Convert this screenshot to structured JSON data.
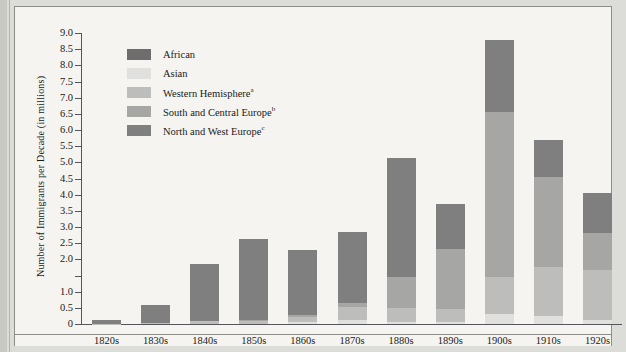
{
  "figure": {
    "ylabel": "Number of Immigrants per Decade (in millions)"
  },
  "legend": {
    "items": [
      {
        "label": "African",
        "sup": "",
        "color": "#6d6d6d",
        "key": "african"
      },
      {
        "label": "Asian",
        "sup": "",
        "color": "#e0e0de",
        "key": "asian"
      },
      {
        "label": "Western Hemisphere",
        "sup": "a",
        "color": "#bdbdbb",
        "key": "western_hemisphere"
      },
      {
        "label": "South and Central Europe",
        "sup": "b",
        "color": "#a6a6a4",
        "key": "south_central_europe"
      },
      {
        "label": "North and West Europe",
        "sup": "c",
        "color": "#7f7f7f",
        "key": "north_west_europe"
      }
    ]
  },
  "axis": {
    "ticks": [
      {
        "value": 9.0,
        "label": "9.0"
      },
      {
        "value": 8.5,
        "label": "8.5"
      },
      {
        "value": 8.0,
        "label": "8.0"
      },
      {
        "value": 7.5,
        "label": "7.5"
      },
      {
        "value": 7.0,
        "label": "7.0"
      },
      {
        "value": 6.5,
        "label": "6.5"
      },
      {
        "value": 6.0,
        "label": "6.0"
      },
      {
        "value": 5.5,
        "label": "5.5"
      },
      {
        "value": 5.0,
        "label": "5.0"
      },
      {
        "value": 4.5,
        "label": "4.5"
      },
      {
        "value": 4.0,
        "label": "4.0"
      },
      {
        "value": 3.5,
        "label": "3.5"
      },
      {
        "value": 3.0,
        "label": "3.0"
      },
      {
        "value": 2.5,
        "label": "2.5"
      },
      {
        "value": 2.0,
        "label": "2.0"
      },
      {
        "value": 1.5,
        "label": ""
      },
      {
        "value": 1.0,
        "label": "1.0"
      },
      {
        "value": 0.5,
        "label": "0.5"
      },
      {
        "value": 0.0,
        "label": "0"
      }
    ]
  },
  "chart_data": {
    "type": "bar",
    "subtype": "stacked",
    "title": "",
    "xlabel": "",
    "ylabel": "Number of Immigrants per Decade (in millions)",
    "ylim": [
      0,
      9.0
    ],
    "ytick_step": 0.5,
    "grid": false,
    "legend_position": "inside-top-left",
    "categories": [
      "1820s",
      "1830s",
      "1840s",
      "1850s",
      "1860s",
      "1870s",
      "1880s",
      "1890s",
      "1900s",
      "1910s",
      "1920s"
    ],
    "series": [
      {
        "name": "African",
        "color": "#6d6d6d",
        "values": [
          0.0,
          0.0,
          0.0,
          0.0,
          0.0,
          0.0,
          0.0,
          0.0,
          0.0,
          0.0,
          0.0
        ]
      },
      {
        "name": "Asian",
        "color": "#e0e0de",
        "values": [
          0.0,
          0.0,
          0.0,
          0.0,
          0.05,
          0.12,
          0.07,
          0.07,
          0.3,
          0.25,
          0.11
        ]
      },
      {
        "name": "Western Hemisphere",
        "color": "#bdbdbb",
        "values": [
          0.01,
          0.03,
          0.08,
          0.08,
          0.17,
          0.4,
          0.43,
          0.4,
          1.15,
          1.5,
          1.55
        ]
      },
      {
        "name": "South and Central Europe",
        "color": "#a6a6a4",
        "values": [
          0.0,
          0.0,
          0.0,
          0.03,
          0.05,
          0.13,
          0.95,
          1.85,
          5.1,
          2.8,
          1.15
        ]
      },
      {
        "name": "North and West Europe",
        "color": "#7f7f7f",
        "values": [
          0.11,
          0.56,
          1.79,
          2.51,
          2.03,
          2.2,
          3.7,
          1.38,
          2.25,
          1.15,
          1.25
        ]
      }
    ],
    "totals": [
      0.15,
      0.6,
      1.9,
      2.65,
      2.33,
      2.85,
      5.2,
      3.75,
      8.8,
      5.7,
      4.1
    ],
    "stack_order_bottom_to_top": [
      "African",
      "Asian",
      "Western Hemisphere",
      "South and Central Europe",
      "North and West Europe"
    ]
  }
}
